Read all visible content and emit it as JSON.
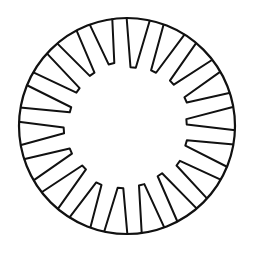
{
  "figure": {
    "title": "",
    "stroke_color": "#111111",
    "background_color": "#ffffff",
    "slot_count": 18,
    "inner_to_outer_ratio": 0.57,
    "slot_outer_half_width_deg": 6.2,
    "slot_inner_half_width_deg": 2.6,
    "start_angle_deg": -84
  }
}
